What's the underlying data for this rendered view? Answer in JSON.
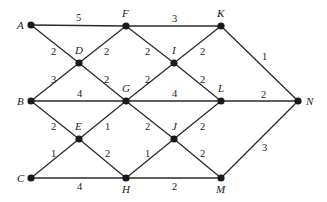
{
  "diagram": {
    "type": "weighted-graph",
    "nodes": [
      {
        "id": "A",
        "label": "A",
        "x": 31,
        "y": 25,
        "lx": 17,
        "ly": 29
      },
      {
        "id": "F",
        "label": "F",
        "x": 126,
        "y": 26,
        "lx": 122,
        "ly": 17
      },
      {
        "id": "K",
        "label": "K",
        "x": 221,
        "y": 26,
        "lx": 217,
        "ly": 17
      },
      {
        "id": "D",
        "label": "D",
        "x": 79,
        "y": 63,
        "lx": 75,
        "ly": 54
      },
      {
        "id": "I",
        "label": "I",
        "x": 174,
        "y": 63,
        "lx": 172,
        "ly": 54
      },
      {
        "id": "B",
        "label": "B",
        "x": 31,
        "y": 101,
        "lx": 17,
        "ly": 105
      },
      {
        "id": "G",
        "label": "G",
        "x": 126,
        "y": 101,
        "lx": 122,
        "ly": 92
      },
      {
        "id": "L",
        "label": "L",
        "x": 221,
        "y": 101,
        "lx": 218,
        "ly": 92
      },
      {
        "id": "N",
        "label": "N",
        "x": 298,
        "y": 101,
        "lx": 306,
        "ly": 105
      },
      {
        "id": "E",
        "label": "E",
        "x": 79,
        "y": 139,
        "lx": 75,
        "ly": 130
      },
      {
        "id": "J",
        "label": "J",
        "x": 174,
        "y": 139,
        "lx": 172,
        "ly": 130
      },
      {
        "id": "C",
        "label": "C",
        "x": 31,
        "y": 178,
        "lx": 17,
        "ly": 182
      },
      {
        "id": "H",
        "label": "H",
        "x": 126,
        "y": 178,
        "lx": 122,
        "ly": 193
      },
      {
        "id": "M",
        "label": "M",
        "x": 221,
        "y": 178,
        "lx": 216,
        "ly": 193
      }
    ],
    "edges": [
      {
        "from": "A",
        "to": "F",
        "weight": "5",
        "wx": 76,
        "wy": 21
      },
      {
        "from": "F",
        "to": "K",
        "weight": "3",
        "wx": 172,
        "wy": 22
      },
      {
        "from": "A",
        "to": "D",
        "weight": "2",
        "wx": 51,
        "wy": 55
      },
      {
        "from": "F",
        "to": "D",
        "weight": "2",
        "wx": 104,
        "wy": 55
      },
      {
        "from": "F",
        "to": "I",
        "weight": "2",
        "wx": 145,
        "wy": 55
      },
      {
        "from": "K",
        "to": "I",
        "weight": "2",
        "wx": 200,
        "wy": 55
      },
      {
        "from": "K",
        "to": "N",
        "weight": "1",
        "wx": 262,
        "wy": 60
      },
      {
        "from": "B",
        "to": "D",
        "weight": "3",
        "wx": 51,
        "wy": 83
      },
      {
        "from": "D",
        "to": "G",
        "weight": "2",
        "wx": 104,
        "wy": 83
      },
      {
        "from": "G",
        "to": "I",
        "weight": "2",
        "wx": 145,
        "wy": 83
      },
      {
        "from": "I",
        "to": "L",
        "weight": "2",
        "wx": 200,
        "wy": 83
      },
      {
        "from": "B",
        "to": "G",
        "weight": "4",
        "wx": 77,
        "wy": 97
      },
      {
        "from": "G",
        "to": "L",
        "weight": "4",
        "wx": 172,
        "wy": 97
      },
      {
        "from": "L",
        "to": "N",
        "weight": "2",
        "wx": 261,
        "wy": 98
      },
      {
        "from": "B",
        "to": "E",
        "weight": "2",
        "wx": 51,
        "wy": 130
      },
      {
        "from": "G",
        "to": "E",
        "weight": "1",
        "wx": 105,
        "wy": 130
      },
      {
        "from": "G",
        "to": "J",
        "weight": "2",
        "wx": 145,
        "wy": 130
      },
      {
        "from": "L",
        "to": "J",
        "weight": "2",
        "wx": 200,
        "wy": 130
      },
      {
        "from": "C",
        "to": "E",
        "weight": "1",
        "wx": 51,
        "wy": 157
      },
      {
        "from": "E",
        "to": "H",
        "weight": "2",
        "wx": 105,
        "wy": 157
      },
      {
        "from": "H",
        "to": "J",
        "weight": "1",
        "wx": 145,
        "wy": 157
      },
      {
        "from": "J",
        "to": "M",
        "weight": "2",
        "wx": 200,
        "wy": 157
      },
      {
        "from": "M",
        "to": "N",
        "weight": "3",
        "wx": 262,
        "wy": 151
      },
      {
        "from": "C",
        "to": "H",
        "weight": "4",
        "wx": 77,
        "wy": 190
      },
      {
        "from": "H",
        "to": "M",
        "weight": "2",
        "wx": 172,
        "wy": 190
      }
    ]
  }
}
